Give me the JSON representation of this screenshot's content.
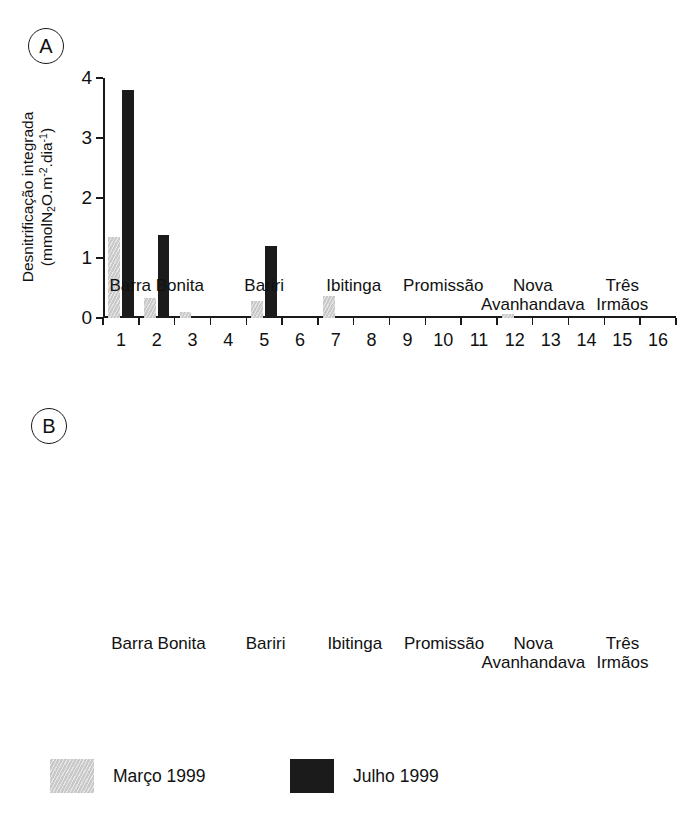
{
  "figure": {
    "panel_a_tag": "A",
    "panel_b_tag": "B"
  },
  "legend": {
    "items": [
      {
        "label": "Março 1999",
        "color": "#c9c9c9",
        "key": "marco"
      },
      {
        "label": "Julho 1999",
        "color": "#1b1b1b",
        "key": "julho"
      }
    ]
  },
  "stations": [
    "1",
    "2",
    "3",
    "4",
    "5",
    "6",
    "7",
    "8",
    "9",
    "10",
    "11",
    "12",
    "13",
    "14",
    "15",
    "16"
  ],
  "reservoirs": [
    {
      "name": "Barra Bonita",
      "line1": "Barra Bonita",
      "line2": "",
      "stations": [
        1,
        2,
        3
      ]
    },
    {
      "name": "Bariri",
      "line1": "Bariri",
      "line2": "",
      "stations": [
        4,
        5,
        6
      ]
    },
    {
      "name": "Ibitinga",
      "line1": "Ibitinga",
      "line2": "",
      "stations": [
        7,
        8
      ]
    },
    {
      "name": "Promissão",
      "line1": "Promissão",
      "line2": "",
      "stations": [
        9,
        10,
        11
      ]
    },
    {
      "name": "Nova Avanhandava",
      "line1": "Nova",
      "line2": "Avanhandava",
      "stations": [
        12,
        13
      ]
    },
    {
      "name": "Três Irmãos",
      "line1": "Três",
      "line2": "Irmãos",
      "stations": [
        14,
        15,
        16
      ]
    }
  ],
  "chart_data": [
    {
      "panel": "A",
      "type": "bar",
      "title": "",
      "ylabel_line1": "Desnitrificação integrada",
      "ylabel_line2": "(mmolN2O.m-2.dia-1)",
      "xlabel": "",
      "ylim": [
        0,
        4
      ],
      "yticks": [
        0,
        1,
        2,
        3,
        4
      ],
      "ytick_labels": [
        "0",
        "1",
        "2",
        "3",
        "4"
      ],
      "grid": false,
      "legend_position": "bottom",
      "categories": [
        "1",
        "2",
        "3",
        "4",
        "5",
        "6",
        "7",
        "8",
        "9",
        "10",
        "11",
        "12",
        "13",
        "14",
        "15",
        "16"
      ],
      "series": [
        {
          "name": "Março 1999",
          "key": "marco",
          "values": [
            1.35,
            0.33,
            0.1,
            0,
            0.28,
            0,
            0.37,
            0,
            0,
            0,
            0,
            0.07,
            0,
            0,
            0,
            0
          ]
        },
        {
          "name": "Julho 1999",
          "key": "julho",
          "values": [
            3.8,
            1.38,
            0,
            0,
            1.2,
            0,
            0,
            0,
            0,
            0,
            0,
            0,
            0,
            0,
            0,
            0
          ]
        }
      ]
    },
    {
      "panel": "B",
      "type": "bar",
      "title": "",
      "ylabel_line1": "Oxigênio dissolvido (mg.l-1)",
      "ylabel_line2": "",
      "xlabel": "",
      "ylim": [
        0,
        10
      ],
      "yticks": [
        0,
        2,
        4,
        6,
        8,
        10
      ],
      "ytick_labels": [
        "0",
        "2",
        "4",
        "6",
        "8",
        "10"
      ],
      "grid": false,
      "legend_position": "bottom",
      "categories": [
        "1",
        "2",
        "3",
        "4",
        "5",
        "6",
        "7",
        "8",
        "9",
        "10",
        "11",
        "12",
        "13",
        "14",
        "15",
        "16"
      ],
      "series": [
        {
          "name": "Março 1999",
          "key": "marco",
          "values": [
            2.6,
            2.65,
            3.8,
            6.95,
            3.05,
            6.75,
            1.15,
            5.5,
            8.2,
            3.95,
            6.1,
            0,
            7.2,
            6.7,
            6.9,
            7.75
          ]
        },
        {
          "name": "Julho 1999",
          "key": "julho",
          "values": [
            0.12,
            0,
            5.05,
            5.45,
            0,
            5.1,
            6.75,
            7.2,
            7.45,
            7.9,
            8.0,
            7.6,
            7.9,
            6.1,
            6.9,
            7.95
          ]
        }
      ]
    }
  ]
}
